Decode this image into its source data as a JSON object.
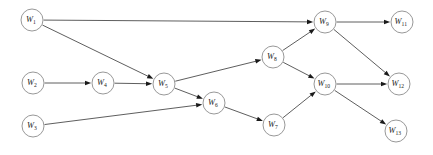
{
  "figure": {
    "background_color": "#ffffff",
    "node_fill": "#ffffff",
    "node_stroke": "#8c8c8c",
    "edge_color": "#4c4c4c",
    "arrow_color": "#1a1a1a",
    "label_color": "#1a1a1a",
    "node_radius": 11
  },
  "chart_data": {
    "type": "diagram",
    "subtype": "directed-graph",
    "title": "",
    "node_count": 13,
    "edge_count": 15,
    "nodes": [
      {
        "id": "W1",
        "base": "W",
        "subscript": "1",
        "label": "W1",
        "x": 32,
        "y": 20
      },
      {
        "id": "W2",
        "base": "W",
        "subscript": "2",
        "label": "W2",
        "x": 33,
        "y": 83
      },
      {
        "id": "W3",
        "base": "W",
        "subscript": "3",
        "label": "W3",
        "x": 33,
        "y": 126
      },
      {
        "id": "W4",
        "base": "W",
        "subscript": "4",
        "label": "W4",
        "x": 103,
        "y": 83
      },
      {
        "id": "W5",
        "base": "W",
        "subscript": "5",
        "label": "W5",
        "x": 164,
        "y": 84
      },
      {
        "id": "W6",
        "base": "W",
        "subscript": "6",
        "label": "W6",
        "x": 214,
        "y": 103
      },
      {
        "id": "W7",
        "base": "W",
        "subscript": "7",
        "label": "W7",
        "x": 274,
        "y": 125
      },
      {
        "id": "W8",
        "base": "W",
        "subscript": "8",
        "label": "W8",
        "x": 273,
        "y": 57
      },
      {
        "id": "W9",
        "base": "W",
        "subscript": "9",
        "label": "W9",
        "x": 325,
        "y": 22
      },
      {
        "id": "W10",
        "base": "W",
        "subscript": "10",
        "label": "W10",
        "x": 325,
        "y": 84
      },
      {
        "id": "W11",
        "base": "W",
        "subscript": "11",
        "label": "W11",
        "x": 402,
        "y": 22
      },
      {
        "id": "W12",
        "base": "W",
        "subscript": "12",
        "label": "W12",
        "x": 399,
        "y": 84
      },
      {
        "id": "W13",
        "base": "W",
        "subscript": "13",
        "label": "W13",
        "x": 396,
        "y": 131
      }
    ],
    "edges": [
      {
        "from": "W1",
        "to": "W9"
      },
      {
        "from": "W1",
        "to": "W5"
      },
      {
        "from": "W2",
        "to": "W4"
      },
      {
        "from": "W3",
        "to": "W6"
      },
      {
        "from": "W4",
        "to": "W5"
      },
      {
        "from": "W5",
        "to": "W8"
      },
      {
        "from": "W5",
        "to": "W6"
      },
      {
        "from": "W6",
        "to": "W7"
      },
      {
        "from": "W7",
        "to": "W10"
      },
      {
        "from": "W8",
        "to": "W9"
      },
      {
        "from": "W8",
        "to": "W10"
      },
      {
        "from": "W9",
        "to": "W11"
      },
      {
        "from": "W9",
        "to": "W12"
      },
      {
        "from": "W10",
        "to": "W12"
      },
      {
        "from": "W10",
        "to": "W13"
      }
    ]
  }
}
